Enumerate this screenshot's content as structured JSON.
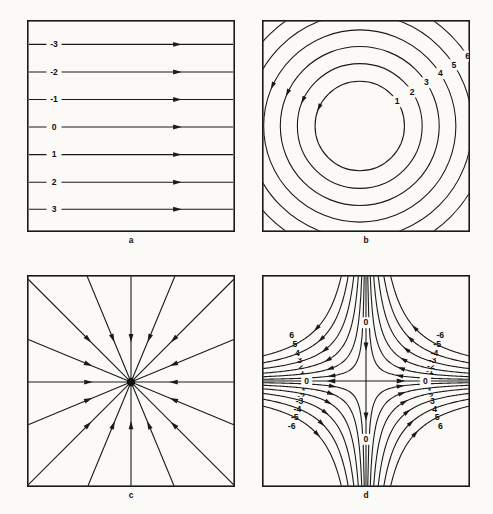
{
  "figure": {
    "background_color": "#fbfaf7",
    "ink_color": "#1a1a1a",
    "panel_count": 4
  },
  "panels": [
    {
      "id": "a",
      "caption": "a",
      "name": "uniform-flow-panel",
      "field_type": "uniform-horizontal-flow",
      "description": "Parallel horizontal streamlines with rightward arrows",
      "frame": {
        "x": 27,
        "y": 20,
        "w": 208,
        "h": 212
      },
      "arrow_direction": "right",
      "arrow_x_fraction": 0.72,
      "label_x_fraction": 0.13,
      "streamlines": [
        {
          "label": "-3",
          "y_fraction": 0.115
        },
        {
          "label": "-2",
          "y_fraction": 0.245
        },
        {
          "label": "-1",
          "y_fraction": 0.375
        },
        {
          "label": "0",
          "y_fraction": 0.505
        },
        {
          "label": "1",
          "y_fraction": 0.635
        },
        {
          "label": "2",
          "y_fraction": 0.765
        },
        {
          "label": "3",
          "y_fraction": 0.893
        }
      ]
    },
    {
      "id": "b",
      "caption": "b",
      "name": "circular-vortex-panel",
      "field_type": "concentric-circular-flow",
      "description": "Concentric circular streamlines about a central vortex, counterclockwise",
      "frame": {
        "x": 262,
        "y": 20,
        "w": 208,
        "h": 212
      },
      "center_fraction": {
        "x": 0.47,
        "y": 0.5
      },
      "rotation": "counterclockwise",
      "contours": [
        {
          "label": "1",
          "radius_fraction": 0.215,
          "label_angle_deg": 33
        },
        {
          "label": "2",
          "radius_fraction": 0.3,
          "label_angle_deg": 33
        },
        {
          "label": "3",
          "radius_fraction": 0.382,
          "label_angle_deg": 33
        },
        {
          "label": "4",
          "radius_fraction": 0.462,
          "label_angle_deg": 33
        },
        {
          "label": "5",
          "radius_fraction": 0.54,
          "label_angle_deg": 33
        },
        {
          "label": "6",
          "radius_fraction": 0.618,
          "label_angle_deg": 33
        }
      ],
      "arrow_angle_deg": 205
    },
    {
      "id": "c",
      "caption": "c",
      "name": "radial-sink-panel",
      "field_type": "radial-inward-flow",
      "description": "Sixteen straight spokes converging inward on a central node",
      "frame": {
        "x": 27,
        "y": 275,
        "w": 208,
        "h": 212
      },
      "center_fraction": {
        "x": 0.5,
        "y": 0.505
      },
      "spoke_count": 16,
      "arrow_direction": "inward",
      "arrow_radius_fraction": 0.42,
      "hub_radius": 4.2
    },
    {
      "id": "d",
      "caption": "d",
      "name": "saddle-flow-panel",
      "field_type": "hyperbolic-saddle-flow",
      "description": "Hyperbolic streamlines about a saddle point with zero-valued separatrix axes",
      "frame": {
        "x": 262,
        "y": 275,
        "w": 208,
        "h": 212
      },
      "center_fraction": {
        "x": 0.5,
        "y": 0.5
      },
      "axis_labels": [
        {
          "text": "0",
          "x_fraction": 0.5,
          "y_fraction": 0.225
        },
        {
          "text": "0",
          "x_fraction": 0.5,
          "y_fraction": 0.775
        },
        {
          "text": "0",
          "x_fraction": 0.215,
          "y_fraction": 0.5
        },
        {
          "text": "0",
          "x_fraction": 0.785,
          "y_fraction": 0.5
        }
      ],
      "vertical_axis_flow": "downward",
      "horizontal_axis_flow": "outward",
      "quadrants": [
        {
          "name": "top-left",
          "sign": "positive",
          "labels": [
            "1",
            "2",
            "3",
            "4",
            "5",
            "6"
          ]
        },
        {
          "name": "top-right",
          "sign": "negative",
          "labels": [
            "-1",
            "-2",
            "-3",
            "-4",
            "-5",
            "-6"
          ]
        },
        {
          "name": "bottom-left",
          "sign": "negative",
          "labels": [
            "-1",
            "-2",
            "-3",
            "-4",
            "-5",
            "-6"
          ]
        },
        {
          "name": "bottom-right",
          "sign": "positive",
          "labels": [
            "1",
            "2",
            "3",
            "4",
            "5",
            "6"
          ]
        }
      ],
      "hyperbola_constants": [
        0.016,
        0.04,
        0.073,
        0.116,
        0.17,
        0.235
      ]
    }
  ]
}
